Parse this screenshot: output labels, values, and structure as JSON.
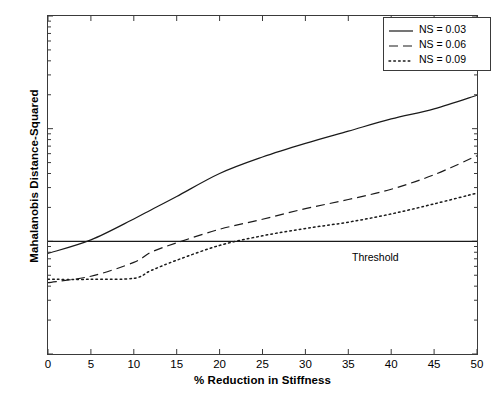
{
  "chart_data": {
    "type": "line",
    "title": "",
    "xlabel": "% Reduction in Stiffness",
    "ylabel": "Mahalanobis Distance-Squared",
    "xlim": [
      0,
      50
    ],
    "ylim": [
      10,
      10000
    ],
    "yscale": "log",
    "grid": false,
    "legend_position": "top-right",
    "xticks": [
      "0",
      "5",
      "10",
      "15",
      "20",
      "25",
      "30",
      "35",
      "40",
      "45",
      "50"
    ],
    "xtick_values": [
      0,
      5,
      10,
      15,
      20,
      25,
      30,
      35,
      40,
      45,
      50
    ],
    "ytick_values": [
      10,
      100,
      1000,
      10000
    ],
    "ytick_mantissas": [
      "10",
      "10",
      "10",
      "10"
    ],
    "ytick_exponents": [
      "1",
      "2",
      "3",
      "4"
    ],
    "x": [
      0,
      5,
      10,
      12,
      15,
      20,
      25,
      30,
      35,
      40,
      45,
      50
    ],
    "series": [
      {
        "name": "NS = 0.03",
        "label": "NS = 0.03",
        "style": "solid",
        "color": "#1a1a1a",
        "values": [
          78,
          103,
          158,
          190,
          250,
          400,
          560,
          740,
          950,
          1220,
          1500,
          1980
        ]
      },
      {
        "name": "NS = 0.06",
        "label": "NS = 0.06",
        "style": "dashed",
        "color": "#1a1a1a",
        "values": [
          43,
          49,
          65,
          80,
          97,
          128,
          157,
          195,
          235,
          290,
          390,
          575
        ]
      },
      {
        "name": "NS = 0.09",
        "label": "NS = 0.09",
        "style": "dotted",
        "color": "#1a1a1a",
        "values": [
          46,
          46,
          47,
          55,
          68,
          92,
          112,
          130,
          148,
          175,
          215,
          268
        ]
      }
    ],
    "annotations": [
      {
        "name": "threshold-line",
        "type": "hline",
        "label": "Threshold",
        "value": 100,
        "style": "solid",
        "color": "#1a1a1a"
      }
    ]
  },
  "axes": {
    "y_title": "Mahalanobis Distance-Squared",
    "x_title": "% Reduction in Stiffness"
  },
  "legend": {
    "items": [
      {
        "label": "NS = 0.03",
        "style": "solid"
      },
      {
        "label": "NS = 0.06",
        "style": "dashed"
      },
      {
        "label": "NS = 0.09",
        "style": "dotted"
      }
    ]
  },
  "threshold": {
    "label": "Threshold"
  }
}
